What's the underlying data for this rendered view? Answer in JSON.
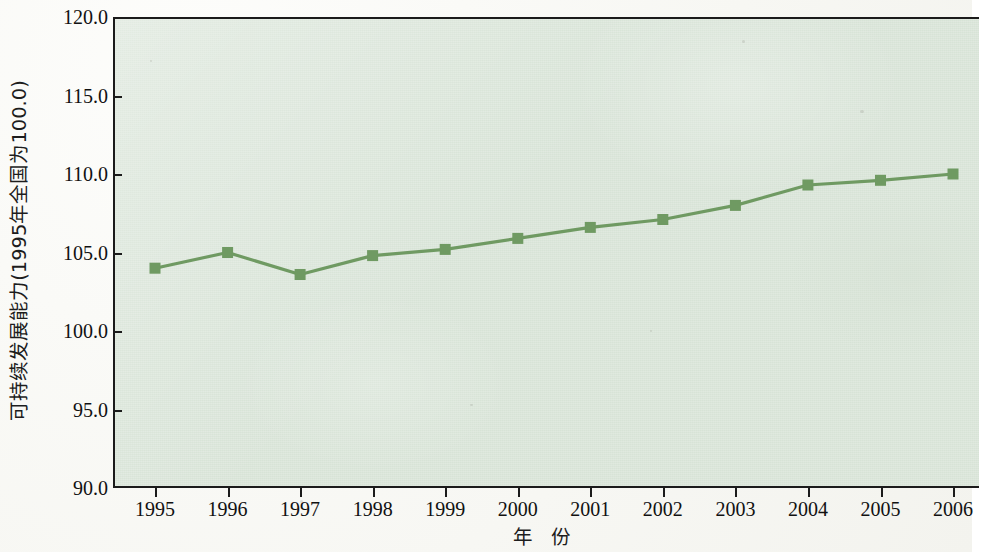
{
  "chart_data": {
    "type": "line",
    "title": "",
    "xlabel": "年  份",
    "ylabel": "可持续发展能力(1995年全国为100.0)",
    "categories": [
      "1995",
      "1996",
      "1997",
      "1998",
      "1999",
      "2000",
      "2001",
      "2002",
      "2003",
      "2004",
      "2005",
      "2006"
    ],
    "x": [
      1995,
      1996,
      1997,
      1998,
      1999,
      2000,
      2001,
      2002,
      2003,
      2004,
      2005,
      2006
    ],
    "values": [
      104.0,
      105.0,
      103.6,
      104.8,
      105.2,
      105.9,
      106.6,
      107.1,
      108.0,
      109.3,
      109.6,
      110.0
    ],
    "series": [
      {
        "name": "可持续发展能力",
        "values": [
          104.0,
          105.0,
          103.6,
          104.8,
          105.2,
          105.9,
          106.6,
          107.1,
          108.0,
          109.3,
          109.6,
          110.0
        ]
      }
    ],
    "ylim": [
      90.0,
      120.0
    ],
    "yticks": [
      "90.0",
      "95.0",
      "100.0",
      "105.0",
      "110.0",
      "115.0",
      "120.0"
    ],
    "ytick_values": [
      90.0,
      95.0,
      100.0,
      105.0,
      110.0,
      115.0,
      120.0
    ],
    "grid": false,
    "legend": "none",
    "marker": "square",
    "colors": {
      "line": "#6f9a62",
      "marker": "#6f9a62",
      "plot_background": "#d7e3d6",
      "axis": "#1b1b1b",
      "text": "#111111",
      "figure_background": "#f7f7f3"
    }
  }
}
